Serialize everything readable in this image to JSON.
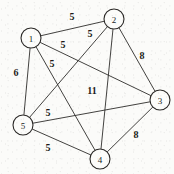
{
  "figure": {
    "background_color": "#fbfbf9",
    "stroke_color": "#2e2c2a",
    "text_color": "#1d1b1a",
    "node_fill_color": "#fcfcfa",
    "width": 174,
    "height": 174
  },
  "chart_data": {
    "type": "diagram",
    "graph_type": "undirected weighted complete graph",
    "title": "",
    "xlabel": "",
    "ylabel": "",
    "node_count": 5,
    "edge_count": 10,
    "nodes": [
      {
        "id": "1",
        "label": "1",
        "x": 31,
        "y": 38,
        "r": 10
      },
      {
        "id": "2",
        "label": "2",
        "x": 114,
        "y": 19,
        "r": 10
      },
      {
        "id": "3",
        "label": "3",
        "x": 160,
        "y": 100,
        "r": 10
      },
      {
        "id": "4",
        "label": "4",
        "x": 100,
        "y": 159,
        "r": 10
      },
      {
        "id": "5",
        "label": "5",
        "x": 23,
        "y": 125,
        "r": 10
      }
    ],
    "edges": [
      {
        "from": "1",
        "to": "2",
        "weight": "5",
        "label_x": 72,
        "label_y": 16
      },
      {
        "from": "1",
        "to": "3",
        "weight": "5",
        "label_x": 63,
        "label_y": 44
      },
      {
        "from": "1",
        "to": "4",
        "weight": "5",
        "label_x": 52,
        "label_y": 63
      },
      {
        "from": "1",
        "to": "5",
        "weight": "6",
        "label_x": 16,
        "label_y": 72
      },
      {
        "from": "2",
        "to": "3",
        "weight": "8",
        "label_x": 142,
        "label_y": 55
      },
      {
        "from": "2",
        "to": "4",
        "weight": "11",
        "label_x": 92,
        "label_y": 90
      },
      {
        "from": "2",
        "to": "5",
        "weight": "5",
        "label_x": 90,
        "label_y": 33
      },
      {
        "from": "3",
        "to": "4",
        "weight": "8",
        "label_x": 136,
        "label_y": 134
      },
      {
        "from": "3",
        "to": "5",
        "weight": "5",
        "label_x": 48,
        "label_y": 112
      },
      {
        "from": "4",
        "to": "5",
        "weight": "5",
        "label_x": 48,
        "label_y": 147
      }
    ]
  }
}
